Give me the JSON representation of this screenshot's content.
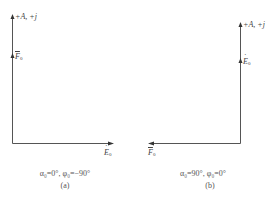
{
  "diagrams": [
    {
      "id": "a",
      "axis_label": "+A, +j",
      "vertical_phasor": {
        "symbol": "F",
        "subscript": "0",
        "accent": "bar"
      },
      "horizontal_phasor": {
        "symbol": "E",
        "subscript": "0",
        "accent": "dot",
        "direction": "right"
      },
      "condition": "α₀=0°, φ₀=−90°",
      "label": "(a)"
    },
    {
      "id": "b",
      "axis_label": "+A, +j",
      "vertical_phasor": {
        "symbol": "E",
        "subscript": "0",
        "accent": "dot"
      },
      "horizontal_phasor": {
        "symbol": "F",
        "subscript": "0",
        "accent": "bar",
        "direction": "left"
      },
      "condition": "α₀=90°, φ₀=0°",
      "label": "(b)"
    }
  ],
  "colors": {
    "line": "#555555",
    "text": "#444444",
    "background": "#ffffff"
  }
}
